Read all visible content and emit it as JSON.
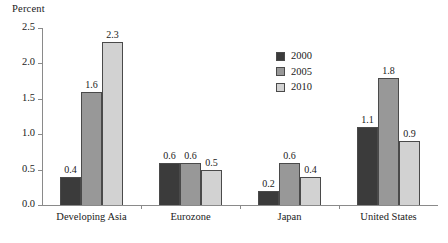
{
  "chart_data": {
    "type": "bar",
    "title": "",
    "subtitle": "",
    "xlabel": "",
    "ylabel": "Percent",
    "ylim": [
      0.0,
      2.5
    ],
    "ytick_labels": [
      "0.0",
      "0.5",
      "1.0",
      "1.5",
      "2.0",
      "2.5"
    ],
    "ytick_values": [
      0.0,
      0.5,
      1.0,
      1.5,
      2.0,
      2.5
    ],
    "grid": false,
    "legend_position": "upper-center-right",
    "categories": [
      "Developing Asia",
      "Eurozone",
      "Japan",
      "United States"
    ],
    "series": [
      {
        "name": "2000",
        "color": "#3b3b3b",
        "values": [
          0.4,
          0.6,
          0.2,
          1.1
        ],
        "value_labels": [
          "0.4",
          "0.6",
          "0.2",
          "1.1"
        ]
      },
      {
        "name": "2005",
        "color": "#989898",
        "values": [
          1.6,
          0.6,
          0.6,
          1.8
        ],
        "value_labels": [
          "1.6",
          "0.6",
          "0.6",
          "1.8"
        ]
      },
      {
        "name": "2010",
        "color": "#d2d2d2",
        "values": [
          2.3,
          0.5,
          0.4,
          0.9
        ],
        "value_labels": [
          "2.3",
          "0.5",
          "0.4",
          "0.9"
        ]
      }
    ]
  },
  "axis": {
    "y_title": "Percent"
  },
  "legend": {
    "items": [
      {
        "label": "2000",
        "color": "#3b3b3b"
      },
      {
        "label": "2005",
        "color": "#989898"
      },
      {
        "label": "2010",
        "color": "#d2d2d2"
      }
    ]
  },
  "colors": {
    "axis_line": "#8a8a8a",
    "bar_outline": "#4a4a4a",
    "text": "#1a1a1a",
    "background": "#ffffff"
  }
}
